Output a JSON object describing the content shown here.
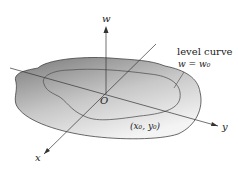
{
  "diagram": {
    "axes": {
      "w": "w",
      "x": "x",
      "y": "y",
      "origin": "O"
    },
    "annotation": {
      "title": "level curve",
      "equation": "w = w₀"
    },
    "point_label": "(x₀, y₀)",
    "colors": {
      "surface_dark": "#8a8a8a",
      "surface_light": "#f2f2f2",
      "line": "#333333"
    }
  }
}
